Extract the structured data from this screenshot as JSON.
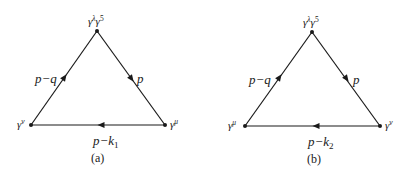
{
  "diagrams": [
    {
      "caption": "(a)",
      "vertices": {
        "top": {
          "base": "γ",
          "sup1": "λ",
          "base2": "γ",
          "sup2": "5"
        },
        "left": {
          "base": "γ",
          "sup": "ν"
        },
        "right": {
          "base": "γ",
          "sup": "μ"
        }
      },
      "edges": {
        "left": {
          "label": "p−q"
        },
        "right": {
          "label": "p"
        },
        "bottom": {
          "label_main": "p−k",
          "label_sub": "1"
        }
      }
    },
    {
      "caption": "(b)",
      "vertices": {
        "top": {
          "base": "γ",
          "sup1": "λ",
          "base2": "γ",
          "sup2": "5"
        },
        "left": {
          "base": "γ",
          "sup": "μ"
        },
        "right": {
          "base": "γ",
          "sup": "ν"
        }
      },
      "edges": {
        "left": {
          "label": "p−q"
        },
        "right": {
          "label": "p"
        },
        "bottom": {
          "label_main": "p−k",
          "label_sub": "2"
        }
      }
    }
  ],
  "colors": {
    "line": "#1a1a1a",
    "background": "#ffffff"
  }
}
